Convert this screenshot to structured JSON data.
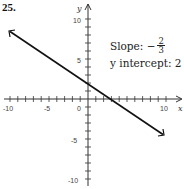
{
  "problem_number": "25.",
  "annotations": {
    "slope_label": "Slope: −",
    "slope_numerator": "2",
    "slope_denominator": "3",
    "intercept_label": "y intercept: 2"
  },
  "axes": {
    "x_label": "x",
    "y_label": "y",
    "x_ticks": [
      "-10",
      "-5",
      "0",
      "10"
    ],
    "y_ticks": [
      "10",
      "5",
      "-5",
      "-10"
    ]
  },
  "chart_data": {
    "type": "line",
    "title": "",
    "xlabel": "x",
    "ylabel": "y",
    "xlim": [
      -10,
      10
    ],
    "ylim": [
      -10,
      10
    ],
    "grid": false,
    "series": [
      {
        "name": "y = -2/3 x + 2",
        "x": [
          -10,
          10
        ],
        "values": [
          8.67,
          -4.67
        ]
      }
    ],
    "slope": "-2/3",
    "y_intercept": 2,
    "annotations": [
      "Slope: -2/3",
      "y intercept: 2"
    ],
    "x_tick_labels": [
      "-10",
      "-5",
      "0",
      "10"
    ],
    "y_tick_labels": [
      "10",
      "5",
      "-5",
      "-10"
    ]
  }
}
